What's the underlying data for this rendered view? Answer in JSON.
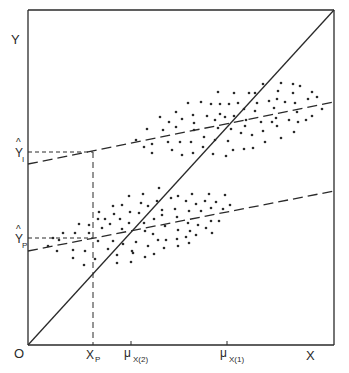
{
  "figure": {
    "axes": {
      "y_label": "Y",
      "x_label": "X",
      "origin_label": "O"
    },
    "y_ticks": [
      {
        "base": "Y",
        "hat": "^",
        "sub": "I",
        "y": 152
      },
      {
        "base": "Y",
        "hat": "^",
        "sub": "P",
        "y": 238
      }
    ],
    "x_ticks": [
      {
        "base": "X",
        "sub": "P",
        "x": 93
      },
      {
        "base": "μ",
        "sub": "X(2)",
        "x": 131
      },
      {
        "base": "μ",
        "sub": "X(1)",
        "x": 227
      }
    ],
    "lines": {
      "diagonal": {
        "style": "solid",
        "from": [
          28,
          345
        ],
        "to": [
          334,
          10
        ]
      },
      "upper_regression": {
        "style": "dashed",
        "from": [
          28,
          164
        ],
        "to": [
          334,
          102
        ]
      },
      "lower_regression": {
        "style": "dashed",
        "from": [
          28,
          251
        ],
        "to": [
          334,
          191
        ]
      },
      "yhat_i_guide": {
        "style": "short-dashed",
        "from": [
          28,
          152
        ],
        "to": [
          93,
          152
        ]
      },
      "yhat_p_guide": {
        "style": "short-dashed",
        "from": [
          28,
          238
        ],
        "to": [
          93,
          238
        ]
      },
      "xp_guide": {
        "style": "dashed",
        "from": [
          93,
          152
        ],
        "to": [
          93,
          345
        ]
      }
    },
    "colors": {
      "ink": "#2a2a2a",
      "background": "#ffffff"
    },
    "upper_cluster": [
      [
        263,
        84
      ],
      [
        281,
        83
      ],
      [
        293,
        84
      ],
      [
        300,
        86
      ],
      [
        218,
        92
      ],
      [
        234,
        93
      ],
      [
        249,
        93
      ],
      [
        255,
        93
      ],
      [
        278,
        91
      ],
      [
        293,
        93
      ],
      [
        312,
        92
      ],
      [
        317,
        97
      ],
      [
        188,
        103
      ],
      [
        201,
        102
      ],
      [
        211,
        104
      ],
      [
        220,
        104
      ],
      [
        229,
        104
      ],
      [
        238,
        103
      ],
      [
        257,
        103
      ],
      [
        269,
        101
      ],
      [
        277,
        99
      ],
      [
        285,
        102
      ],
      [
        295,
        103
      ],
      [
        308,
        99
      ],
      [
        322,
        109
      ],
      [
        176,
        112
      ],
      [
        193,
        115
      ],
      [
        207,
        116
      ],
      [
        220,
        114
      ],
      [
        244,
        109
      ],
      [
        255,
        111
      ],
      [
        274,
        108
      ],
      [
        297,
        112
      ],
      [
        312,
        116
      ],
      [
        160,
        117
      ],
      [
        182,
        119
      ],
      [
        169,
        122
      ],
      [
        194,
        123
      ],
      [
        215,
        120
      ],
      [
        225,
        117
      ],
      [
        234,
        116
      ],
      [
        246,
        120
      ],
      [
        261,
        122
      ],
      [
        272,
        122
      ],
      [
        276,
        118
      ],
      [
        289,
        120
      ],
      [
        298,
        122
      ],
      [
        306,
        120
      ],
      [
        176,
        127
      ],
      [
        231,
        129
      ],
      [
        245,
        126
      ],
      [
        277,
        126
      ],
      [
        147,
        129
      ],
      [
        163,
        130
      ],
      [
        194,
        130
      ],
      [
        218,
        128
      ],
      [
        241,
        133
      ],
      [
        263,
        131
      ],
      [
        294,
        132
      ],
      [
        136,
        140
      ],
      [
        152,
        144
      ],
      [
        168,
        142
      ],
      [
        180,
        142
      ],
      [
        191,
        142
      ],
      [
        204,
        137
      ],
      [
        215,
        140
      ],
      [
        228,
        141
      ],
      [
        252,
        135
      ],
      [
        265,
        142
      ],
      [
        281,
        138
      ],
      [
        144,
        147
      ],
      [
        172,
        150
      ],
      [
        203,
        147
      ],
      [
        233,
        150
      ],
      [
        244,
        149
      ],
      [
        253,
        148
      ],
      [
        152,
        153
      ],
      [
        182,
        155
      ],
      [
        193,
        153
      ],
      [
        213,
        154
      ],
      [
        226,
        156
      ]
    ],
    "lower_cluster": [
      [
        159,
        188
      ],
      [
        129,
        196
      ],
      [
        143,
        194
      ],
      [
        171,
        198
      ],
      [
        178,
        196
      ],
      [
        192,
        194
      ],
      [
        209,
        194
      ],
      [
        225,
        195
      ],
      [
        113,
        206
      ],
      [
        122,
        205
      ],
      [
        141,
        203
      ],
      [
        148,
        206
      ],
      [
        157,
        201
      ],
      [
        186,
        201
      ],
      [
        196,
        204
      ],
      [
        205,
        201
      ],
      [
        216,
        202
      ],
      [
        230,
        205
      ],
      [
        99,
        212
      ],
      [
        114,
        214
      ],
      [
        130,
        212
      ],
      [
        139,
        213
      ],
      [
        162,
        210
      ],
      [
        175,
        209
      ],
      [
        189,
        211
      ],
      [
        201,
        211
      ],
      [
        211,
        208
      ],
      [
        223,
        209
      ],
      [
        98,
        219
      ],
      [
        105,
        219
      ],
      [
        120,
        219
      ],
      [
        154,
        219
      ],
      [
        162,
        215
      ],
      [
        177,
        217
      ],
      [
        79,
        224
      ],
      [
        89,
        225
      ],
      [
        110,
        224
      ],
      [
        129,
        223
      ],
      [
        144,
        223
      ],
      [
        165,
        226
      ],
      [
        188,
        223
      ],
      [
        198,
        225
      ],
      [
        211,
        221
      ],
      [
        219,
        221
      ],
      [
        63,
        233
      ],
      [
        75,
        233
      ],
      [
        89,
        233
      ],
      [
        102,
        228
      ],
      [
        122,
        229
      ],
      [
        145,
        231
      ],
      [
        153,
        234
      ],
      [
        178,
        230
      ],
      [
        190,
        231
      ],
      [
        206,
        228
      ],
      [
        212,
        233
      ],
      [
        53,
        238
      ],
      [
        59,
        240
      ],
      [
        98,
        241
      ],
      [
        113,
        241
      ],
      [
        136,
        242
      ],
      [
        158,
        240
      ],
      [
        166,
        240
      ],
      [
        177,
        239
      ],
      [
        186,
        237
      ],
      [
        196,
        235
      ],
      [
        48,
        246
      ],
      [
        57,
        251
      ],
      [
        73,
        250
      ],
      [
        85,
        251
      ],
      [
        108,
        249
      ],
      [
        123,
        244
      ],
      [
        132,
        251
      ],
      [
        148,
        246
      ],
      [
        164,
        248
      ],
      [
        178,
        246
      ],
      [
        189,
        243
      ],
      [
        73,
        258
      ],
      [
        95,
        259
      ],
      [
        117,
        255
      ],
      [
        133,
        253
      ],
      [
        145,
        257
      ],
      [
        154,
        254
      ],
      [
        84,
        265
      ],
      [
        117,
        263
      ],
      [
        131,
        262
      ]
    ]
  }
}
